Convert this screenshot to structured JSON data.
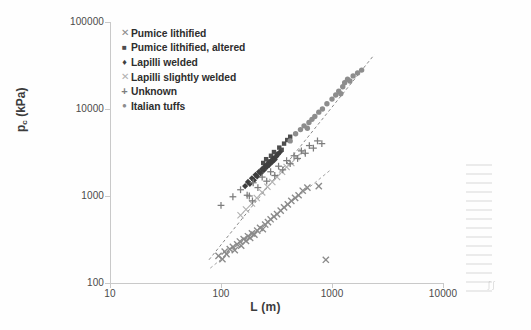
{
  "figure": {
    "background": "#fefefe"
  },
  "axes": {
    "x_title": "L (m)",
    "y_title_main": "p",
    "y_title_sub": "c",
    "y_title_unit": " (kPa)",
    "x_ticks": [
      "10",
      "100",
      "1000",
      "10000"
    ],
    "y_ticks": [
      "100",
      "1000",
      "10000",
      "100000"
    ],
    "axis_color": "#c9c9c9"
  },
  "legend": {
    "items": [
      {
        "label": "Pumice lithified",
        "marker": "x-cross",
        "glyph": "✕",
        "color": "#8a8a8a"
      },
      {
        "label": "Pumice lithified, altered",
        "marker": "filled-square",
        "glyph": "■",
        "color": "#4d4d4d"
      },
      {
        "label": "Lapilli welded",
        "marker": "filled-diamond",
        "glyph": "♦",
        "color": "#3f3f3f"
      },
      {
        "label": "Lapilli slightly welded",
        "marker": "x-cross-light",
        "glyph": "✕",
        "color": "#b0b0b0"
      },
      {
        "label": "Unknown",
        "marker": "plus-cross",
        "glyph": "+",
        "color": "#7d7d7d"
      },
      {
        "label": "Italian tuffs",
        "marker": "filled-circle",
        "glyph": "●",
        "color": "#8d8d8d"
      }
    ]
  },
  "chart_data": {
    "type": "scatter",
    "title": "",
    "xlabel": "L (m)",
    "ylabel": "p_c (kPa)",
    "xscale": "log",
    "yscale": "log",
    "xlim": [
      10,
      10000
    ],
    "ylim": [
      100,
      100000
    ],
    "grid": false,
    "legend_position": "top-left-inside",
    "series": [
      {
        "name": "Pumice lithified",
        "marker": "x-cross",
        "color": "#8a8a8a",
        "points": [
          [
            95,
            205
          ],
          [
            103,
            188
          ],
          [
            108,
            230
          ],
          [
            112,
            215
          ],
          [
            120,
            245
          ],
          [
            128,
            260
          ],
          [
            133,
            238
          ],
          [
            140,
            278
          ],
          [
            148,
            300
          ],
          [
            152,
            268
          ],
          [
            160,
            320
          ],
          [
            168,
            305
          ],
          [
            175,
            345
          ],
          [
            183,
            330
          ],
          [
            190,
            372
          ],
          [
            200,
            360
          ],
          [
            212,
            400
          ],
          [
            225,
            430
          ],
          [
            238,
            415
          ],
          [
            250,
            470
          ],
          [
            265,
            500
          ],
          [
            280,
            540
          ],
          [
            300,
            580
          ],
          [
            320,
            620
          ],
          [
            345,
            680
          ],
          [
            370,
            740
          ],
          [
            400,
            800
          ],
          [
            430,
            880
          ],
          [
            465,
            950
          ],
          [
            500,
            1020
          ],
          [
            545,
            1150
          ],
          [
            600,
            1250
          ],
          [
            760,
            1300
          ],
          [
            880,
            185
          ]
        ]
      },
      {
        "name": "Pumice lithified, altered",
        "marker": "filled-square",
        "color": "#4d4d4d",
        "points": [
          [
            240,
            2400
          ],
          [
            255,
            2650
          ],
          [
            268,
            2500
          ],
          [
            282,
            2900
          ],
          [
            300,
            3200
          ],
          [
            318,
            3050
          ],
          [
            335,
            3600
          ],
          [
            352,
            3400
          ],
          [
            370,
            4000
          ],
          [
            395,
            4400
          ],
          [
            420,
            4800
          ]
        ]
      },
      {
        "name": "Lapilli welded",
        "marker": "filled-diamond",
        "color": "#3f3f3f",
        "points": [
          [
            165,
            1300
          ],
          [
            175,
            1450
          ],
          [
            182,
            1380
          ],
          [
            190,
            1600
          ],
          [
            198,
            1520
          ],
          [
            205,
            1750
          ],
          [
            212,
            1680
          ],
          [
            220,
            1900
          ],
          [
            228,
            1820
          ],
          [
            235,
            2050
          ],
          [
            243,
            1980
          ],
          [
            250,
            2200
          ],
          [
            258,
            2150
          ],
          [
            265,
            2350
          ],
          [
            272,
            2280
          ],
          [
            280,
            2500
          ],
          [
            288,
            2450
          ],
          [
            296,
            2700
          ],
          [
            305,
            2620
          ],
          [
            315,
            2850
          ],
          [
            325,
            3000
          ],
          [
            340,
            3200
          ]
        ]
      },
      {
        "name": "Lapilli slightly welded",
        "marker": "x-cross-light",
        "color": "#b0b0b0",
        "points": [
          [
            150,
            600
          ],
          [
            168,
            700
          ],
          [
            190,
            820
          ],
          [
            210,
            950
          ],
          [
            235,
            1100
          ],
          [
            262,
            1280
          ],
          [
            290,
            1450
          ],
          [
            320,
            1650
          ],
          [
            355,
            1900
          ],
          [
            390,
            2150
          ],
          [
            430,
            2400
          ],
          [
            480,
            2800
          ],
          [
            540,
            3200
          ]
        ]
      },
      {
        "name": "Unknown",
        "marker": "plus-cross",
        "color": "#7d7d7d",
        "points": [
          [
            100,
            780
          ],
          [
            128,
            980
          ],
          [
            150,
            1180
          ],
          [
            172,
            1020
          ],
          [
            195,
            1420
          ],
          [
            215,
            1250
          ],
          [
            235,
            1650
          ],
          [
            258,
            1480
          ],
          [
            280,
            1900
          ],
          [
            305,
            1720
          ],
          [
            330,
            2200
          ],
          [
            360,
            2000
          ],
          [
            390,
            2550
          ],
          [
            420,
            2350
          ],
          [
            455,
            2900
          ],
          [
            490,
            2700
          ],
          [
            530,
            3300
          ],
          [
            575,
            3100
          ],
          [
            625,
            3800
          ],
          [
            680,
            3550
          ],
          [
            740,
            4300
          ],
          [
            810,
            4000
          ],
          [
            180,
            1000
          ],
          [
            192,
            880
          ]
        ]
      },
      {
        "name": "Italian tuffs",
        "marker": "filled-circle",
        "color": "#8d8d8d",
        "points": [
          [
            420,
            4300
          ],
          [
            470,
            5200
          ],
          [
            520,
            5800
          ],
          [
            560,
            6400
          ],
          [
            600,
            6000
          ],
          [
            620,
            7000
          ],
          [
            660,
            7600
          ],
          [
            700,
            8200
          ],
          [
            760,
            9200
          ],
          [
            820,
            10000
          ],
          [
            900,
            11500
          ],
          [
            1000,
            13000
          ],
          [
            1080,
            14500
          ],
          [
            1150,
            16000
          ],
          [
            1200,
            15000
          ],
          [
            1250,
            18000
          ],
          [
            1300,
            20000
          ],
          [
            1380,
            22000
          ],
          [
            1450,
            21000
          ],
          [
            1550,
            24000
          ],
          [
            1700,
            26000
          ],
          [
            1850,
            28000
          ]
        ]
      }
    ],
    "trendlines": [
      {
        "name": "upper-trend",
        "style": "dashed",
        "color": "#7a7a7a",
        "x_start": 78,
        "y_start": 185,
        "x_end": 2400,
        "y_end": 42000
      },
      {
        "name": "lower-trend",
        "style": "dashed",
        "color": "#9a9a9a",
        "x_start": 80,
        "y_start": 148,
        "x_end": 950,
        "y_end": 1950
      }
    ]
  }
}
